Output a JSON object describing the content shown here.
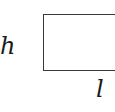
{
  "diagram": {
    "shape": "rectangle",
    "labels": {
      "height": "h",
      "length": "l"
    },
    "stroke_color": "#3a3a3a"
  }
}
